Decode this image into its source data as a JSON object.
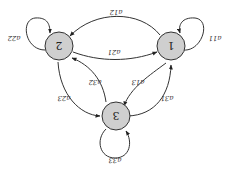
{
  "diagram": {
    "type": "state-transition",
    "orientation": "rotated-180",
    "nodes": [
      {
        "id": "1",
        "label": "1"
      },
      {
        "id": "2",
        "label": "2"
      },
      {
        "id": "3",
        "label": "3"
      }
    ],
    "edges": [
      {
        "from": "1",
        "to": "1",
        "label": "a11"
      },
      {
        "from": "2",
        "to": "2",
        "label": "a22"
      },
      {
        "from": "3",
        "to": "3",
        "label": "a33"
      },
      {
        "from": "1",
        "to": "2",
        "label": "a12"
      },
      {
        "from": "2",
        "to": "1",
        "label": "a21"
      },
      {
        "from": "2",
        "to": "3",
        "label": "a23"
      },
      {
        "from": "3",
        "to": "2",
        "label": "a32"
      },
      {
        "from": "1",
        "to": "3",
        "label": "a13"
      },
      {
        "from": "3",
        "to": "1",
        "label": "a31"
      }
    ],
    "node_fill": "#cfcfcf"
  }
}
